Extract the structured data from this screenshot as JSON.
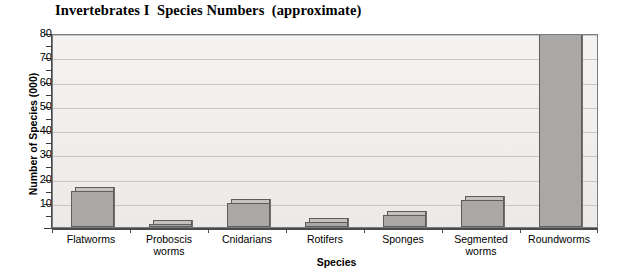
{
  "chart_data": {
    "type": "bar",
    "title": "Invertebrates I  Species Numbers  (approximate)",
    "xlabel": "Species",
    "ylabel": "Number of Species (000)",
    "categories": [
      "Flatworms",
      "Proboscis worms",
      "Cnidarians",
      "Rotifers",
      "Sponges",
      "Segmented worms",
      "Roundworms"
    ],
    "category_lines": [
      [
        "Flatworms"
      ],
      [
        "Proboscis",
        "worms"
      ],
      [
        "Cnidarians"
      ],
      [
        "Rotifers"
      ],
      [
        "Sponges"
      ],
      [
        "Segmented",
        "worms"
      ],
      [
        "Roundworms"
      ]
    ],
    "values": [
      15,
      1,
      10,
      2,
      5,
      11,
      80
    ],
    "ylim": [
      0,
      80
    ],
    "ytick_major": [
      0,
      10,
      20,
      30,
      40,
      50,
      60,
      70,
      80
    ],
    "ytick_major_labels": [
      "",
      "10",
      "20",
      "30",
      "40",
      "50",
      "60",
      "70",
      "80"
    ],
    "ytick_minor": [
      5,
      15,
      25,
      35,
      45,
      55,
      65,
      75
    ],
    "grid": true,
    "grid_axis": "y",
    "legend": false,
    "bar_color": "#a9a8a6",
    "bar_edge_color": "#5e5d5b",
    "bar_shadow_color": "#6f6e6c",
    "plot_background": "#efeeec",
    "gridline_color": "#c9c7c4",
    "axis_color": "#4a4a4a",
    "text_color": "#000000",
    "style": "3d-bar"
  }
}
